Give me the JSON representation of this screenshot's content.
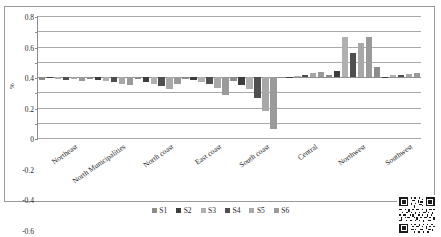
{
  "chart_data": {
    "type": "bar",
    "title": "",
    "subtitle": "",
    "xlabel": "",
    "ylabel": "%",
    "ylim": [
      -0.8,
      0.8
    ],
    "ytick_step": 0.2,
    "yticks": [
      "0.8",
      "0.6",
      "0.4",
      "0.2",
      "0",
      "-0.2",
      "-0.4",
      "-0.6",
      "-0.8"
    ],
    "ytick_values": [
      0.8,
      0.6,
      0.4,
      0.2,
      0,
      -0.2,
      -0.4,
      -0.6,
      -0.8
    ],
    "grid": true,
    "legend_position": "bottom",
    "orientation": "vertical",
    "grouping": "clustered",
    "categories": [
      "Northeast",
      "North Municipalities",
      "North coast",
      "East coast",
      "South coast",
      "Central",
      "Northwest",
      "Southwest"
    ],
    "series": [
      {
        "name": "S1",
        "color": "#8c8c8c",
        "values": [
          -0.04,
          -0.03,
          -0.02,
          -0.02,
          -0.05,
          -0.01,
          0.02,
          0.13
        ]
      },
      {
        "name": "S2",
        "color": "#3d3d3d",
        "values": [
          -0.01,
          -0.04,
          -0.07,
          -0.04,
          -0.11,
          0.0,
          0.08,
          -0.01
        ]
      },
      {
        "name": "S3",
        "color": "#b0b0b0",
        "values": [
          -0.03,
          -0.05,
          -0.09,
          -0.06,
          -0.16,
          0.01,
          0.21,
          0.02
        ]
      },
      {
        "name": "S4",
        "color": "#4f4f4f",
        "values": [
          -0.04,
          -0.07,
          -0.12,
          -0.09,
          -0.28,
          0.03,
          0.32,
          0.03
        ]
      },
      {
        "name": "S5",
        "color": "#a8a8a8",
        "values": [
          -0.02,
          -0.09,
          -0.16,
          -0.15,
          -0.45,
          0.05,
          0.45,
          0.04
        ]
      },
      {
        "name": "S6",
        "color": "#9a9a9a",
        "values": [
          -0.05,
          -0.1,
          -0.09,
          -0.24,
          -0.68,
          0.06,
          0.52,
          0.05
        ]
      }
    ],
    "highlight_bars": [
      {
        "category": "Northwest",
        "series": "S3",
        "value": 0.53
      }
    ]
  },
  "legend": {
    "items": [
      {
        "label": "S1",
        "color": "#8c8c8c"
      },
      {
        "label": "S2",
        "color": "#3d3d3d"
      },
      {
        "label": "S3",
        "color": "#b0b0b0"
      },
      {
        "label": "S4",
        "color": "#4f4f4f"
      },
      {
        "label": "S5",
        "color": "#a8a8a8"
      },
      {
        "label": "S6",
        "color": "#9a9a9a"
      }
    ]
  },
  "decorations": {
    "qr_code": "qr-code-icon"
  }
}
